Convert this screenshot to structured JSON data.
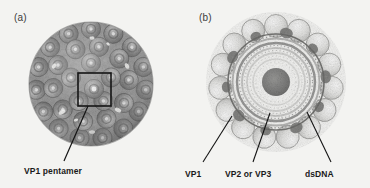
{
  "figure": {
    "background_color": "#f3f3f1",
    "width": 370,
    "height": 188
  },
  "panel_a": {
    "label": "(a)",
    "view": "exterior surface view of icosahedral capsid",
    "callout_label": "VP1 pentamer",
    "highlight_box": {
      "shape": "square",
      "stroke_color": "#1a1a1a",
      "x": 78,
      "y": 73,
      "size": 33
    },
    "leader_line": {
      "from_x": 88,
      "from_y": 106,
      "to_x": 64,
      "to_y": 162,
      "stroke_color": "#1a1a1a"
    },
    "capsid": {
      "center_x": 91,
      "center_y": 84,
      "radius": 62,
      "fill_tone": "#8d8d8d",
      "capsomere_count": 72,
      "texture": "dense granular speckle"
    }
  },
  "panel_b": {
    "label": "(b)",
    "view": "central cross-section of capsid",
    "callouts": [
      {
        "name": "vp1",
        "label": "VP1",
        "target_x": 47,
        "target_y": 116,
        "text_x": 8,
        "text_y": 168
      },
      {
        "name": "vp2-or-vp3",
        "label": "VP2 or VP3",
        "target_x": 85,
        "target_y": 113,
        "text_x": 48,
        "text_y": 168
      },
      {
        "name": "dsdna",
        "label": "dsDNA",
        "target_x": 122,
        "target_y": 112,
        "text_x": 124,
        "text_y": 168
      }
    ],
    "capsid": {
      "center_x": 91,
      "center_y": 82,
      "outer_radius": 66,
      "shell_radius": 48,
      "inner_shell_radius": 40,
      "core_radius": 14,
      "fill_tone": "#d8d8d6",
      "capsomere_count": 20,
      "texture": "light granular speckle"
    }
  },
  "colors": {
    "background": "#f3f3f1",
    "ink": "#1a1a1a",
    "panel_label": "#3c3c3c",
    "capsid_dark": "#6f6f6f",
    "capsid_mid": "#9a9a9a",
    "capsid_light": "#cfcfcd"
  }
}
